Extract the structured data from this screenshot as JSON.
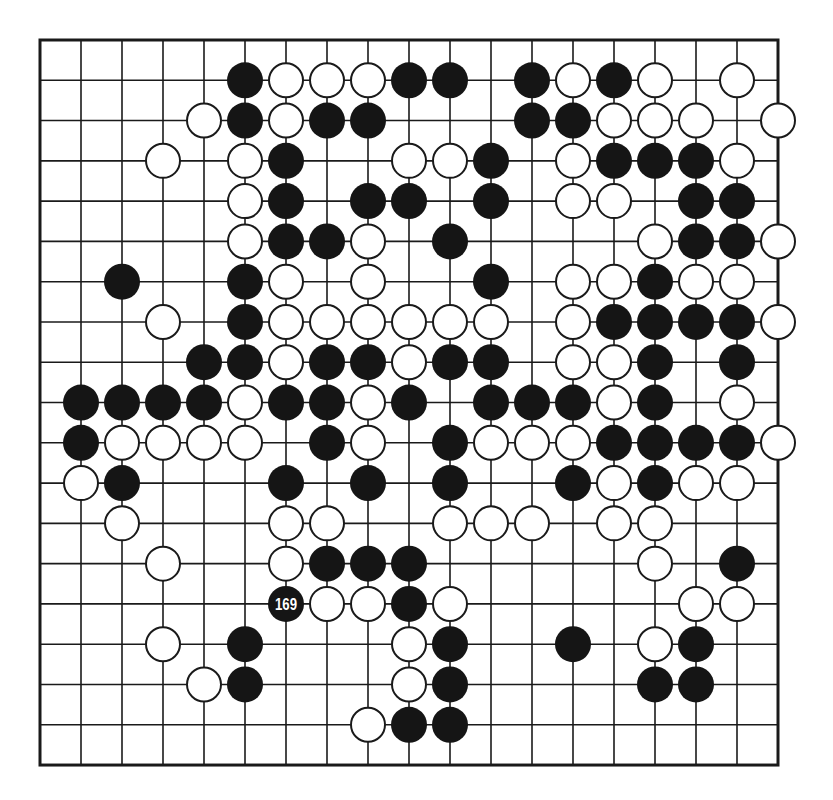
{
  "board": {
    "size": 19,
    "origin_x": 40,
    "origin_y": 40,
    "spacing_x": 41,
    "spacing_y": 40.28,
    "stone_radius": 18,
    "colors": {
      "black": "#151515",
      "white": "#ffffff",
      "line": "#1a1a1a",
      "background": "#ffffff"
    }
  },
  "stones": {
    "rows": [
      {
        "row": 0,
        "black": [],
        "white": []
      },
      {
        "row": 1,
        "black": [
          5,
          9,
          10,
          12,
          14
        ],
        "white": [
          6,
          7,
          8,
          13,
          15,
          17
        ]
      },
      {
        "row": 2,
        "black": [
          5,
          7,
          8,
          12,
          13
        ],
        "white": [
          4,
          6,
          14,
          15,
          16,
          18
        ]
      },
      {
        "row": 3,
        "black": [
          6,
          11,
          14,
          15,
          16
        ],
        "white": [
          3,
          5,
          9,
          10,
          13,
          17
        ]
      },
      {
        "row": 4,
        "black": [
          6,
          8,
          9,
          11,
          16,
          17
        ],
        "white": [
          5,
          13,
          14
        ]
      },
      {
        "row": 5,
        "black": [
          6,
          7,
          10,
          16,
          17
        ],
        "white": [
          5,
          8,
          15,
          18
        ]
      },
      {
        "row": 6,
        "black": [
          2,
          5,
          11,
          15
        ],
        "white": [
          6,
          8,
          13,
          14,
          16,
          17
        ]
      },
      {
        "row": 7,
        "black": [
          5,
          14,
          15,
          16,
          17
        ],
        "white": [
          3,
          6,
          7,
          8,
          9,
          10,
          11,
          13,
          18
        ]
      },
      {
        "row": 8,
        "black": [
          4,
          5,
          7,
          8,
          10,
          11,
          15,
          17
        ],
        "white": [
          6,
          9,
          13,
          14
        ]
      },
      {
        "row": 9,
        "black": [
          1,
          2,
          3,
          4,
          6,
          7,
          9,
          11,
          12,
          13,
          15
        ],
        "white": [
          5,
          8,
          14,
          17
        ]
      },
      {
        "row": 10,
        "black": [
          1,
          7,
          10,
          14,
          15,
          16,
          17
        ],
        "white": [
          2,
          3,
          4,
          5,
          8,
          11,
          12,
          13,
          18
        ]
      },
      {
        "row": 11,
        "black": [
          2,
          6,
          8,
          10,
          13,
          15
        ],
        "white": [
          1,
          14,
          16,
          17
        ]
      },
      {
        "row": 12,
        "black": [],
        "white": [
          2,
          6,
          7,
          10,
          11,
          12,
          14,
          15
        ]
      },
      {
        "row": 13,
        "black": [
          7,
          8,
          9,
          17
        ],
        "white": [
          3,
          6,
          15
        ]
      },
      {
        "row": 14,
        "black": [
          6,
          9
        ],
        "white": [
          7,
          8,
          10,
          16,
          17
        ]
      },
      {
        "row": 15,
        "black": [
          5,
          10,
          13,
          16
        ],
        "white": [
          3,
          9,
          15
        ]
      },
      {
        "row": 16,
        "black": [
          5,
          10,
          15,
          16
        ],
        "white": [
          4,
          9
        ]
      },
      {
        "row": 17,
        "black": [
          9,
          10
        ],
        "white": [
          8
        ]
      },
      {
        "row": 18,
        "black": [],
        "white": []
      }
    ]
  },
  "labels": [
    {
      "col": 6,
      "row": 14,
      "text": "169",
      "stone": "black"
    }
  ]
}
